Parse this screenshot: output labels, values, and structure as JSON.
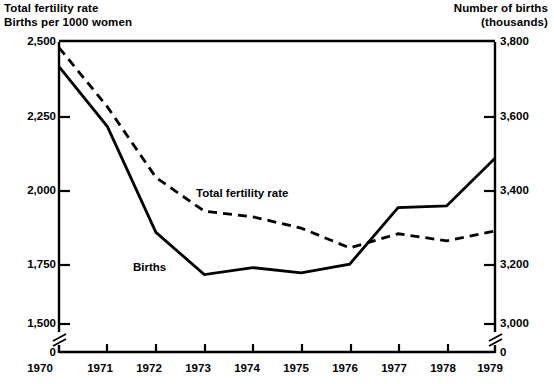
{
  "chart_data": {
    "type": "line",
    "title": "",
    "x": [
      1970,
      1971,
      1972,
      1973,
      1974,
      1975,
      1976,
      1977,
      1978,
      1979
    ],
    "xlabel": "",
    "xtick_labels": [
      "1970",
      "1971",
      "1972",
      "1973",
      "1974",
      "1975",
      "1976",
      "1977",
      "1978",
      "1979"
    ],
    "grid": false,
    "legend_position": "inline-annotations",
    "axes": [
      {
        "side": "left",
        "label": "Total fertility rate\nBirths per 1000 women",
        "ticks": [
          2500,
          2250,
          2000,
          1750,
          1500
        ],
        "tick_labels": [
          "2,500",
          "2,250",
          "2,000",
          "1,750",
          "1,500"
        ],
        "zero_label": "0",
        "axis_break": true,
        "ylim": [
          1500,
          2500
        ]
      },
      {
        "side": "right",
        "label": "Number of births\n(thousands)",
        "ticks": [
          3800,
          3600,
          3400,
          3200,
          3000
        ],
        "tick_labels": [
          "3,800",
          "3,600",
          "3,400",
          "3,200",
          "3,000"
        ],
        "zero_label": "0",
        "axis_break": true,
        "ylim": [
          3000,
          3800
        ]
      }
    ],
    "series": [
      {
        "name": "Total fertility rate",
        "axis": "left",
        "style": "dashed",
        "color": "#000000",
        "annotation": "Total fertility rate",
        "values": [
          2480,
          2270,
          2020,
          1900,
          1880,
          1840,
          1770,
          1820,
          1795,
          1830
        ]
      },
      {
        "name": "Births",
        "axis": "right",
        "style": "solid",
        "color": "#000000",
        "annotation": "Births",
        "values": [
          3730,
          3560,
          3260,
          3140,
          3160,
          3145,
          3170,
          3330,
          3335,
          3470
        ]
      }
    ]
  },
  "annotations": {
    "total_fertility_rate": "Total fertility rate",
    "births": "Births"
  }
}
